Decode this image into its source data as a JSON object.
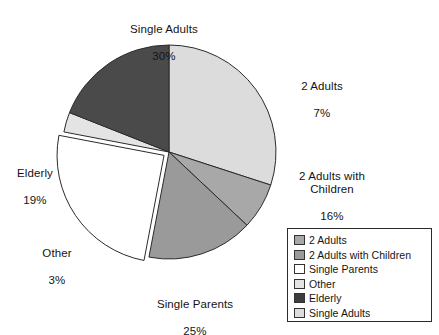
{
  "chart_data": {
    "type": "pie",
    "title": "",
    "subtitle": "",
    "xlabel": "",
    "ylabel": "",
    "grid": false,
    "legend_position": "bottom-right",
    "units": "percent",
    "start_angle_deg": 0,
    "direction": "clockwise",
    "categories": [
      "Single Adults",
      "2 Adults",
      "2 Adults with Children",
      "Single Parents",
      "Other",
      "Elderly"
    ],
    "values": [
      30,
      7,
      16,
      25,
      3,
      19
    ],
    "slices": [
      {
        "label": "Single Adults",
        "value": 30,
        "value_text": "30%",
        "color": "#dcdcdc",
        "exploded": false,
        "start_deg": 0,
        "end_deg": 108
      },
      {
        "label": "2 Adults",
        "value": 7,
        "value_text": "7%",
        "color": "#a8a8a8",
        "exploded": false,
        "start_deg": 108,
        "end_deg": 133.2
      },
      {
        "label": "2 Adults with Children",
        "value": 16,
        "value_text": "16%",
        "color": "#9a9a9a",
        "exploded": false,
        "start_deg": 133.2,
        "end_deg": 190.8
      },
      {
        "label": "Single Parents",
        "value": 25,
        "value_text": "25%",
        "color": "#ffffff",
        "exploded": true,
        "start_deg": 190.8,
        "end_deg": 280.8
      },
      {
        "label": "Other",
        "value": 3,
        "value_text": "3%",
        "color": "#e4e4e4",
        "exploded": false,
        "start_deg": 280.8,
        "end_deg": 291.6
      },
      {
        "label": "Elderly",
        "value": 19,
        "value_text": "19%",
        "color": "#4a4a4a",
        "exploded": false,
        "start_deg": 291.6,
        "end_deg": 360
      }
    ]
  },
  "labels": {
    "single_adults": {
      "name": "Single Adults",
      "pct": "30%"
    },
    "two_adults": {
      "name": "2 Adults",
      "pct": "7%"
    },
    "two_adults_children": {
      "name": "2 Adults with\nChildren",
      "pct": "16%"
    },
    "elderly": {
      "name": "Elderly",
      "pct": "19%"
    },
    "other": {
      "name": "Other",
      "pct": "3%"
    },
    "single_parents": {
      "name": "Single Parents",
      "pct": "25%"
    }
  },
  "legend": {
    "items": [
      {
        "label": "2 Adults",
        "color": "#a8a8a8"
      },
      {
        "label": "2 Adults with Children",
        "color": "#9a9a9a"
      },
      {
        "label": "Single Parents",
        "color": "#ffffff"
      },
      {
        "label": "Other",
        "color": "#e4e4e4"
      },
      {
        "label": "Elderly",
        "color": "#3d3d3d"
      },
      {
        "label": "Single Adults",
        "color": "#dcdcdc"
      }
    ]
  },
  "geometry": {
    "center_x": 169,
    "center_y": 152,
    "radius": 107,
    "explode_offset": 6,
    "stroke": "#2b2b2b",
    "stroke_width": 1
  }
}
